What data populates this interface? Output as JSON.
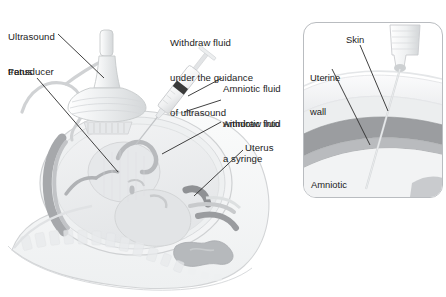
{
  "figure": {
    "background_color": "#ffffff"
  },
  "main_view": {
    "labels": [
      {
        "id": "ultrasound-transducer",
        "text": "Ultrasound\ntransducer",
        "line1": "Ultrasound",
        "line2": "transducer",
        "x": 8,
        "y": 8
      },
      {
        "id": "fetus",
        "text": "Fetus",
        "x": 8,
        "y": 66
      },
      {
        "id": "withdraw-fluid",
        "line1": "Withdraw fluid",
        "line2": "under the guidance",
        "line3": "of ultrasound",
        "x": 170,
        "y": 14
      },
      {
        "id": "amniotic-fluid-syringe",
        "line1": "Amniotic fluid",
        "line2": "withdraw into",
        "line3": "a syringe",
        "x": 223,
        "y": 60
      },
      {
        "id": "amniotic-fluid",
        "text": "Amniotic fluid",
        "x": 223,
        "y": 118
      },
      {
        "id": "uterus",
        "text": "Uterus",
        "x": 245,
        "y": 142
      }
    ]
  },
  "inset_view": {
    "frame": {
      "x": 303,
      "y": 22,
      "width": 140,
      "height": 176,
      "border_color": "#b9bcc0",
      "corner_radius": 13
    },
    "labels": [
      {
        "id": "uterine-wall",
        "line1": "Uterine",
        "line2": "wall",
        "x": 309,
        "y": 48
      },
      {
        "id": "skin",
        "text": "Skin",
        "x": 345,
        "y": 33
      },
      {
        "id": "amniotic-cavity",
        "line1": "Amniotic",
        "line2": "cavity",
        "x": 310,
        "y": 155
      }
    ]
  },
  "colors": {
    "text": "#1c1c1c",
    "leader_line": "#2b2b2b",
    "body_outline": "#d2d4d6",
    "body_fill": "#f4f5f6",
    "uterus_wall_dark": "#9b9da0",
    "uterus_wall_mid": "#b9bbbe",
    "amniotic_fluid": "#eceef0",
    "fetus_fill": "#e2e4e6",
    "transducer_fill": "#eceeef",
    "transducer_outline": "#c6c9cb",
    "syringe_fill": "#f0f1f2",
    "syringe_plunger_dark": "#3a3a3a",
    "skin_layer": "#e6e8ea",
    "intestine": "#b6b9bc",
    "vertebra": "#e8eaec"
  }
}
